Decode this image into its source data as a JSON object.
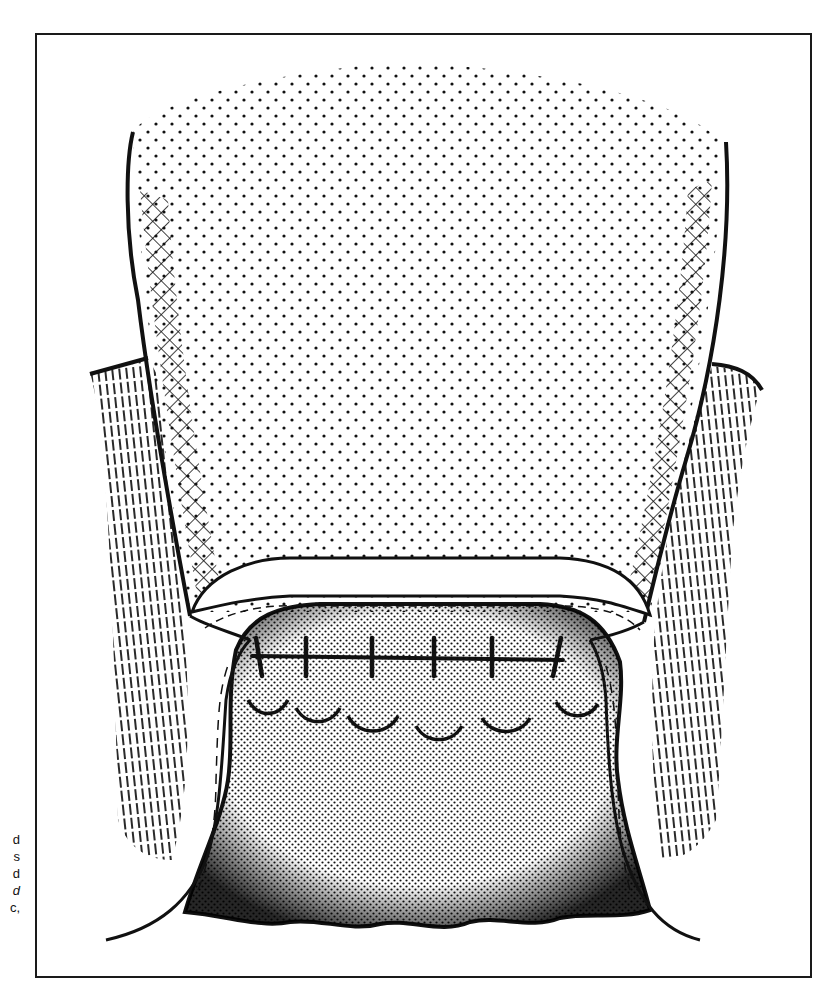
{
  "figure": {
    "type": "surgical-illustration",
    "frame": {
      "x": 36,
      "y": 34,
      "width": 775,
      "height": 943,
      "stroke": "#1a1a1a"
    },
    "colors": {
      "ink": "#111111",
      "paper": "#ffffff"
    },
    "caption_fragments": [
      {
        "text": "d",
        "y": 832,
        "italic": false
      },
      {
        "text": "s",
        "y": 849,
        "italic": false
      },
      {
        "text": "d",
        "y": 866,
        "italic": false
      },
      {
        "text": "d",
        "y": 883,
        "italic": true
      },
      {
        "text": "c,",
        "y": 900,
        "italic": false
      }
    ],
    "upper_flap": {
      "fill": "sparse-dots",
      "edges": "cross-hatched"
    },
    "lateral_tissue": {
      "fill": "vertical-hatching",
      "sides": [
        "left",
        "right"
      ]
    },
    "lower_mass": {
      "fill": "dense-stipple"
    },
    "sutures": {
      "count": 6,
      "x": [
        262,
        306,
        372,
        434,
        492,
        553
      ],
      "y": 664
    }
  }
}
